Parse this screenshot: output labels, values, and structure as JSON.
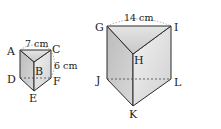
{
  "figure": {
    "type": "triangular-prisms",
    "small_prism": {
      "vertices": [
        "A",
        "B",
        "C",
        "D",
        "E",
        "F"
      ],
      "labels": {
        "A": "A",
        "B": "B",
        "C": "C",
        "D": "D",
        "E": "E",
        "F": "F"
      },
      "measurements": {
        "top_edge": "7 cm",
        "height": "6 cm"
      }
    },
    "large_prism": {
      "vertices": [
        "G",
        "H",
        "I",
        "J",
        "K",
        "L"
      ],
      "labels": {
        "G": "G",
        "H": "H",
        "I": "I",
        "J": "J",
        "K": "K",
        "L": "L"
      },
      "measurements": {
        "top_edge": "14 cm"
      }
    },
    "colors": {
      "edge": "#2a2a2a",
      "top_face": "#d9d9d9",
      "left_face": "#bdbdbd",
      "right_face": "#e6e6e6",
      "dashed": "#444444",
      "measure_arc": "#888888"
    }
  }
}
